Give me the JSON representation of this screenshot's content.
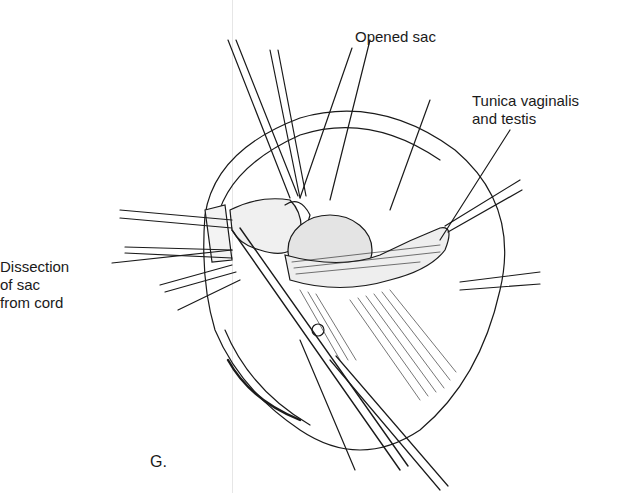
{
  "figure": {
    "panel_letter": "G.",
    "type": "surgical illustration",
    "labels": {
      "opened_sac": "Opened sac",
      "tunica": "Tunica vaginalis\nand testis",
      "dissection": "Dissection\nof sac\nfrom cord"
    },
    "colors": {
      "ink": "#1a1a1a",
      "background": "#ffffff",
      "fold_line": "#e6e6e6"
    }
  }
}
